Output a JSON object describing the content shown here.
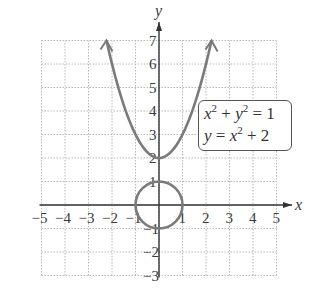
{
  "chart_data": {
    "type": "line",
    "title": "",
    "xlabel": "x",
    "ylabel": "y",
    "xlim": [
      -5,
      5
    ],
    "ylim": [
      -3,
      7
    ],
    "grid": true,
    "x_ticks": [
      "−5",
      "−4",
      "−3",
      "−2",
      "−1",
      "1",
      "2",
      "3",
      "4",
      "5"
    ],
    "y_ticks": [
      "7",
      "6",
      "5",
      "4",
      "3",
      "2",
      "1",
      "−1",
      "−2",
      "−3"
    ],
    "series": [
      {
        "name": "x² + y² = 1",
        "kind": "circle",
        "center": [
          0,
          0
        ],
        "radius": 1,
        "color": "#7a7a7a"
      },
      {
        "name": "y = x² + 2",
        "kind": "parabola",
        "x": [
          -2.236,
          -2,
          -1.5,
          -1,
          -0.5,
          0,
          0.5,
          1,
          1.5,
          2,
          2.236
        ],
        "values": [
          7,
          6,
          4.25,
          3,
          2.25,
          2,
          2.25,
          3,
          4.25,
          6,
          7
        ],
        "arrows_at_ends": true,
        "color": "#7a7a7a"
      }
    ],
    "legend": {
      "position": "inside-right",
      "entries": [
        "x² + y² = 1",
        "y = x² + 2"
      ]
    }
  },
  "legend": {
    "line1": {
      "a": "x",
      "a_exp": "2",
      "op": " + ",
      "b": "y",
      "b_exp": "2",
      "rhs": " = 1"
    },
    "line2": {
      "a": "y",
      "eq": " = ",
      "b": "x",
      "b_exp": "2",
      "rhs": " + 2"
    }
  },
  "axes": {
    "x_label": "x",
    "y_label": "y"
  },
  "colors": {
    "axis": "#333333",
    "grid": "#b8b8b8",
    "curve": "#7a7a7a"
  }
}
